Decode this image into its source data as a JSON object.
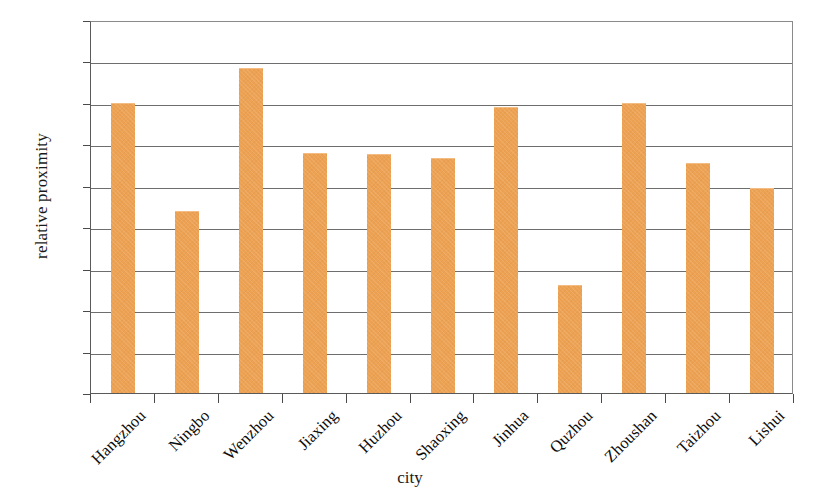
{
  "chart_data": {
    "type": "bar",
    "title": "",
    "subtitle": "",
    "xlabel": "city",
    "ylabel": "relative proximity",
    "categories": [
      "Hangzhou",
      "Ningbo",
      "Wenzhou",
      "Jiaxing",
      "Huzhou",
      "Shaoxing",
      "Jinhua",
      "Quzhou",
      "Zhoushan",
      "Taizhou",
      "Lishui"
    ],
    "values": [
      0.7,
      0.44,
      0.785,
      0.578,
      0.577,
      0.566,
      0.69,
      0.26,
      0.7,
      0.554,
      0.494
    ],
    "series": [
      {
        "name": "relative proximity",
        "values": [
          0.7,
          0.44,
          0.785,
          0.578,
          0.577,
          0.566,
          0.69,
          0.26,
          0.7,
          0.554,
          0.494
        ]
      }
    ],
    "ylim": [
      0.0,
      0.9
    ],
    "ytick_step": 0.1,
    "ytick_labels": [
      "0.90",
      "0.80",
      "0.70",
      "0.60",
      "0.50",
      "0.40",
      "0.30",
      "0.20",
      "0.10",
      "0.00"
    ],
    "ytick_values": [
      0.9,
      0.8,
      0.7,
      0.6,
      0.5,
      0.4,
      0.3,
      0.2,
      0.1,
      0.0
    ],
    "grid": true,
    "grid_axis": "y",
    "legend": false,
    "legend_position": "none",
    "bar_color": "#eda253",
    "bar_edge_color": "#f3bc82",
    "axis_color": "#4a4a4a",
    "gridline_color": "#6e6e6e",
    "background_color": "#ffffff",
    "xlabel_rotation": -45
  }
}
